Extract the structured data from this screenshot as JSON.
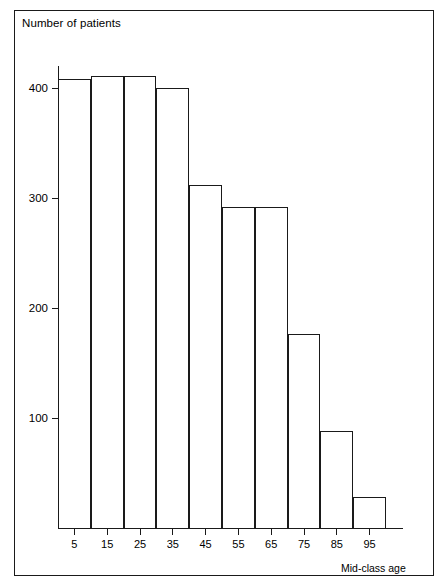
{
  "figure": {
    "y_axis_title": "Number of patients",
    "x_axis_title": "Mid-class age"
  },
  "chart_data": {
    "type": "bar",
    "title": "",
    "subtitle": "",
    "xlabel": "Mid-class age",
    "ylabel": "Number of patients",
    "categories": [
      "5",
      "15",
      "25",
      "35",
      "45",
      "55",
      "65",
      "75",
      "85",
      "95"
    ],
    "values": [
      408,
      411,
      411,
      400,
      312,
      292,
      292,
      176,
      88,
      28
    ],
    "xlim": [
      0,
      100
    ],
    "ylim": [
      0,
      460
    ],
    "yticks": [
      100,
      200,
      300,
      400
    ],
    "ytick_labels": [
      "100",
      "200",
      "300",
      "400"
    ],
    "xticks": [
      5,
      15,
      25,
      35,
      45,
      55,
      65,
      75,
      85,
      95
    ],
    "xtick_labels": [
      "5",
      "15",
      "25",
      "35",
      "45",
      "55",
      "65",
      "75",
      "85",
      "95"
    ],
    "grid": false,
    "legend": null,
    "legend_position": "none",
    "bar_style": "outline",
    "bar_fill": "#ffffff",
    "bar_edge_color": "#1a1a1a",
    "axis_color": "#1a1a1a",
    "background": "#ffffff",
    "histogram": true,
    "class_width": 10,
    "annotations": []
  }
}
